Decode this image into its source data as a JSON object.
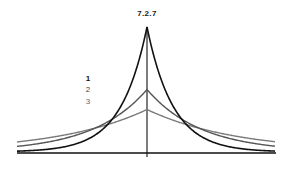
{
  "figure": {
    "title": "7.2.7",
    "legend": [
      {
        "label": "1",
        "color": "#111111"
      },
      {
        "label": "2",
        "color": "#555555"
      },
      {
        "label": "3",
        "color": "#777777"
      }
    ]
  },
  "chart_data": {
    "type": "line",
    "title": "7.2.7",
    "xlabel": "",
    "ylabel": "",
    "grid": false,
    "legend_position": "left-of-center",
    "x": [
      -130,
      -100,
      -80,
      -60,
      -40,
      -20,
      0,
      20,
      40,
      60,
      80,
      100,
      130
    ],
    "series": [
      {
        "name": "1",
        "color": "#111111",
        "peak": 1.0,
        "width": 26,
        "values": [
          0.01,
          0.02,
          0.05,
          0.1,
          0.22,
          0.46,
          1.0,
          0.46,
          0.22,
          0.1,
          0.05,
          0.02,
          0.01
        ]
      },
      {
        "name": "2",
        "color": "#555555",
        "peak": 0.5,
        "width": 54,
        "values": [
          0.05,
          0.08,
          0.11,
          0.16,
          0.24,
          0.35,
          0.5,
          0.35,
          0.24,
          0.16,
          0.11,
          0.08,
          0.05
        ]
      },
      {
        "name": "3",
        "color": "#777777",
        "peak": 0.34,
        "width": 90,
        "values": [
          0.08,
          0.11,
          0.14,
          0.17,
          0.22,
          0.27,
          0.34,
          0.27,
          0.22,
          0.17,
          0.14,
          0.11,
          0.08
        ]
      }
    ]
  }
}
